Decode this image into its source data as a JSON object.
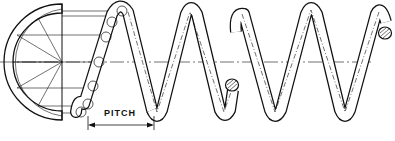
{
  "diagram": {
    "labels": {
      "pitch": "PITCH"
    },
    "components": [
      {
        "name": "construction-semicircle",
        "description": "half end-view of wire circle divided into segments"
      },
      {
        "name": "helix-constructed-coil",
        "description": "first coil showing wire cross-section circles along helix"
      },
      {
        "name": "helix-coil-section-1",
        "description": "spring section ending with cut wire cross-section"
      },
      {
        "name": "helix-coil-section-2",
        "description": "spring section ending with cut wire cross-section"
      },
      {
        "name": "centre-line",
        "description": "dash-dot axis through spring"
      },
      {
        "name": "pitch-dimension",
        "description": "dimension arrow between adjacent coils"
      }
    ],
    "colors": {
      "ink": "#111111",
      "background": "#ffffff"
    }
  }
}
